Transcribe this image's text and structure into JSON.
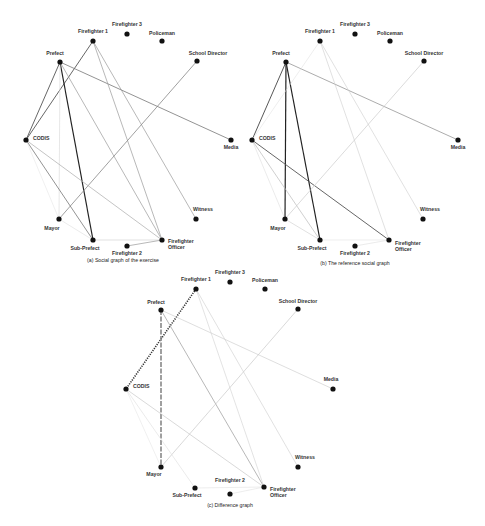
{
  "figure": {
    "panels": [
      {
        "id": "a",
        "caption": "(a) Social graph of the exercise",
        "offset": [
          0,
          0
        ],
        "caption_pos": [
          123,
          262
        ],
        "nodes": [
          {
            "name": "Firefighter 1",
            "x": 93,
            "y": 41,
            "lx": 93,
            "ly": 33,
            "anchor": "middle"
          },
          {
            "name": "Firefighter 3",
            "x": 127,
            "y": 34,
            "lx": 127,
            "ly": 26,
            "anchor": "middle"
          },
          {
            "name": "Policeman",
            "x": 162,
            "y": 41,
            "lx": 162,
            "ly": 35,
            "anchor": "middle"
          },
          {
            "name": "Prefect",
            "x": 60,
            "y": 62,
            "lx": 55,
            "ly": 55,
            "anchor": "middle"
          },
          {
            "name": "School Director",
            "x": 197,
            "y": 61,
            "lx": 208,
            "ly": 55,
            "anchor": "middle"
          },
          {
            "name": "CODIS",
            "x": 26,
            "y": 140,
            "lx": 33,
            "ly": 140,
            "anchor": "start"
          },
          {
            "name": "Media",
            "x": 231,
            "y": 140,
            "lx": 231,
            "ly": 149,
            "anchor": "middle"
          },
          {
            "name": "Mayor",
            "x": 59,
            "y": 219,
            "lx": 52,
            "ly": 230,
            "anchor": "middle"
          },
          {
            "name": "Witness",
            "x": 196,
            "y": 219,
            "lx": 203,
            "ly": 211,
            "anchor": "middle"
          },
          {
            "name": "Sub-Prefect",
            "x": 93,
            "y": 240,
            "lx": 85,
            "ly": 250,
            "anchor": "middle"
          },
          {
            "name": "Firefighter 2",
            "x": 127,
            "y": 246,
            "lx": 127,
            "ly": 255,
            "anchor": "middle"
          },
          {
            "name": "Firefighter Officer",
            "x": 162,
            "y": 240,
            "lx": 168,
            "ly": 243,
            "anchor": "start",
            "multiline": [
              "Firefighter",
              "Officer"
            ]
          }
        ],
        "edges": [
          {
            "from": "Prefect",
            "to": "CODIS",
            "color": "#555555",
            "width": 0.9,
            "style": "solid"
          },
          {
            "from": "Firefighter 1",
            "to": "CODIS",
            "color": "#555555",
            "width": 0.9,
            "style": "solid"
          },
          {
            "from": "Prefect",
            "to": "Sub-Prefect",
            "color": "#222222",
            "width": 1.2,
            "style": "solid"
          },
          {
            "from": "Prefect",
            "to": "Mayor",
            "color": "#dddddd",
            "width": 0.7,
            "style": "solid"
          },
          {
            "from": "Prefect",
            "to": "Media",
            "color": "#777777",
            "width": 0.8,
            "style": "solid"
          },
          {
            "from": "Prefect",
            "to": "Firefighter Officer",
            "color": "#999999",
            "width": 0.7,
            "style": "solid"
          },
          {
            "from": "Firefighter 1",
            "to": "Firefighter Officer",
            "color": "#999999",
            "width": 0.7,
            "style": "solid"
          },
          {
            "from": "Firefighter 1",
            "to": "Witness",
            "color": "#999999",
            "width": 0.7,
            "style": "solid"
          },
          {
            "from": "School Director",
            "to": "Mayor",
            "color": "#888888",
            "width": 0.8,
            "style": "solid"
          },
          {
            "from": "CODIS",
            "to": "Sub-Prefect",
            "color": "#777777",
            "width": 0.8,
            "style": "solid"
          },
          {
            "from": "CODIS",
            "to": "Firefighter Officer",
            "color": "#aaaaaa",
            "width": 0.7,
            "style": "solid"
          },
          {
            "from": "CODIS",
            "to": "Mayor",
            "color": "#e6e6e6",
            "width": 0.6,
            "style": "solid"
          },
          {
            "from": "Mayor",
            "to": "Sub-Prefect",
            "color": "#dddddd",
            "width": 0.6,
            "style": "solid"
          },
          {
            "from": "Sub-Prefect",
            "to": "Firefighter Officer",
            "color": "#cccccc",
            "width": 0.6,
            "style": "solid"
          },
          {
            "from": "Firefighter 2",
            "to": "Firefighter Officer",
            "color": "#999999",
            "width": 0.7,
            "style": "solid"
          }
        ]
      },
      {
        "id": "b",
        "caption": "(b) The reference social graph",
        "offset": [
          226,
          0
        ],
        "caption_pos": [
          129,
          265
        ],
        "nodes": [
          {
            "name": "Firefighter 1",
            "x": 94,
            "y": 41,
            "lx": 94,
            "ly": 33,
            "anchor": "middle"
          },
          {
            "name": "Firefighter 3",
            "x": 129,
            "y": 34,
            "lx": 129,
            "ly": 26,
            "anchor": "middle"
          },
          {
            "name": "Policeman",
            "x": 164,
            "y": 41,
            "lx": 164,
            "ly": 35,
            "anchor": "middle"
          },
          {
            "name": "Prefect",
            "x": 60,
            "y": 62,
            "lx": 55,
            "ly": 55,
            "anchor": "middle"
          },
          {
            "name": "School Director",
            "x": 198,
            "y": 61,
            "lx": 198,
            "ly": 55,
            "anchor": "middle"
          },
          {
            "name": "CODIS",
            "x": 26,
            "y": 140,
            "lx": 33,
            "ly": 140,
            "anchor": "start"
          },
          {
            "name": "Media",
            "x": 232,
            "y": 140,
            "lx": 232,
            "ly": 149,
            "anchor": "middle"
          },
          {
            "name": "Mayor",
            "x": 59,
            "y": 219,
            "lx": 52,
            "ly": 230,
            "anchor": "middle"
          },
          {
            "name": "Witness",
            "x": 197,
            "y": 219,
            "lx": 204,
            "ly": 211,
            "anchor": "middle"
          },
          {
            "name": "Sub-Prefect",
            "x": 94,
            "y": 240,
            "lx": 86,
            "ly": 250,
            "anchor": "middle"
          },
          {
            "name": "Firefighter 2",
            "x": 129,
            "y": 246,
            "lx": 129,
            "ly": 255,
            "anchor": "middle"
          },
          {
            "name": "Firefighter Officer",
            "x": 163,
            "y": 240,
            "lx": 169,
            "ly": 245,
            "anchor": "start",
            "multiline": [
              "Firefighter",
              "Officer"
            ]
          }
        ],
        "edges": [
          {
            "from": "Prefect",
            "to": "CODIS",
            "color": "#444444",
            "width": 0.9,
            "style": "solid"
          },
          {
            "from": "Prefect",
            "to": "Mayor",
            "color": "#222222",
            "width": 1.2,
            "style": "solid"
          },
          {
            "from": "Prefect",
            "to": "Sub-Prefect",
            "color": "#222222",
            "width": 1.2,
            "style": "solid"
          },
          {
            "from": "Prefect",
            "to": "Media",
            "color": "#888888",
            "width": 0.7,
            "style": "solid"
          },
          {
            "from": "CODIS",
            "to": "Firefighter Officer",
            "color": "#555555",
            "width": 0.9,
            "style": "solid"
          },
          {
            "from": "CODIS",
            "to": "Sub-Prefect",
            "color": "#bbbbbb",
            "width": 0.7,
            "style": "solid"
          },
          {
            "from": "CODIS",
            "to": "Mayor",
            "color": "#dddddd",
            "width": 0.6,
            "style": "solid"
          },
          {
            "from": "Firefighter 1",
            "to": "CODIS",
            "color": "#e3e3e3",
            "width": 0.6,
            "style": "solid"
          },
          {
            "from": "Firefighter 1",
            "to": "Firefighter Officer",
            "color": "#cccccc",
            "width": 0.6,
            "style": "solid"
          },
          {
            "from": "Firefighter 1",
            "to": "Witness",
            "color": "#cccccc",
            "width": 0.6,
            "style": "solid"
          },
          {
            "from": "School Director",
            "to": "Mayor",
            "color": "#cccccc",
            "width": 0.7,
            "style": "solid"
          },
          {
            "from": "Mayor",
            "to": "Sub-Prefect",
            "color": "#cccccc",
            "width": 0.6,
            "style": "solid"
          },
          {
            "from": "Sub-Prefect",
            "to": "Firefighter Officer",
            "color": "#e3e3e3",
            "width": 0.6,
            "style": "solid"
          },
          {
            "from": "Firefighter 2",
            "to": "Firefighter Officer",
            "color": "#dddddd",
            "width": 0.6,
            "style": "solid"
          }
        ]
      },
      {
        "id": "c",
        "caption": "(c) Difference graph",
        "offset": [
          101,
          249
        ],
        "caption_pos": [
          129,
          258
        ],
        "nodes": [
          {
            "name": "Firefighter 1",
            "x": 95,
            "y": 40,
            "lx": 95,
            "ly": 32,
            "anchor": "middle"
          },
          {
            "name": "Firefighter 3",
            "x": 129,
            "y": 33,
            "lx": 129,
            "ly": 25,
            "anchor": "middle"
          },
          {
            "name": "Policeman",
            "x": 164,
            "y": 40,
            "lx": 164,
            "ly": 33,
            "anchor": "middle"
          },
          {
            "name": "Prefect",
            "x": 60,
            "y": 61,
            "lx": 55,
            "ly": 55,
            "anchor": "middle"
          },
          {
            "name": "School Director",
            "x": 197,
            "y": 60,
            "lx": 197,
            "ly": 54,
            "anchor": "middle"
          },
          {
            "name": "CODIS",
            "x": 25,
            "y": 140,
            "lx": 32,
            "ly": 139,
            "anchor": "start"
          },
          {
            "name": "Media",
            "x": 232,
            "y": 140,
            "lx": 230,
            "ly": 132,
            "anchor": "middle"
          },
          {
            "name": "Mayor",
            "x": 60,
            "y": 218,
            "lx": 53,
            "ly": 227,
            "anchor": "middle"
          },
          {
            "name": "Witness",
            "x": 197,
            "y": 218,
            "lx": 204,
            "ly": 210,
            "anchor": "middle"
          },
          {
            "name": "Sub-Prefect",
            "x": 94,
            "y": 239,
            "lx": 86,
            "ly": 248,
            "anchor": "middle"
          },
          {
            "name": "Firefighter 2",
            "x": 129,
            "y": 245,
            "lx": 129,
            "ly": 233,
            "anchor": "middle"
          },
          {
            "name": "Firefighter Officer",
            "x": 163,
            "y": 238,
            "lx": 169,
            "ly": 242,
            "anchor": "start",
            "multiline": [
              "Firefighter",
              "Officer"
            ]
          }
        ],
        "edges": [
          {
            "from": "Firefighter 1",
            "to": "CODIS",
            "color": "#333333",
            "width": 1.6,
            "style": "dotted"
          },
          {
            "from": "Prefect",
            "to": "Mayor",
            "color": "#888888",
            "width": 1.6,
            "style": "dashed"
          },
          {
            "from": "Prefect",
            "to": "Firefighter Officer",
            "color": "#999999",
            "width": 0.7,
            "style": "solid"
          },
          {
            "from": "Prefect",
            "to": "Media",
            "color": "#d0d0d0",
            "width": 0.7,
            "style": "solid"
          },
          {
            "from": "Firefighter 1",
            "to": "Firefighter Officer",
            "color": "#d0d0d0",
            "width": 0.6,
            "style": "solid"
          },
          {
            "from": "Firefighter 1",
            "to": "Witness",
            "color": "#cccccc",
            "width": 0.6,
            "style": "solid"
          },
          {
            "from": "School Director",
            "to": "Mayor",
            "color": "#c8c8c8",
            "width": 0.7,
            "style": "solid"
          },
          {
            "from": "CODIS",
            "to": "Firefighter Officer",
            "color": "#c0c0c0",
            "width": 0.6,
            "style": "solid"
          },
          {
            "from": "CODIS",
            "to": "Sub-Prefect",
            "color": "#dddddd",
            "width": 0.6,
            "style": "solid"
          },
          {
            "from": "CODIS",
            "to": "Mayor",
            "color": "#e6e6e6",
            "width": 0.6,
            "style": "solid"
          },
          {
            "from": "Sub-Prefect",
            "to": "Firefighter Officer",
            "color": "#e0e0e0",
            "width": 0.6,
            "style": "solid"
          },
          {
            "from": "Firefighter 2",
            "to": "Firefighter Officer",
            "color": "#e0e0e0",
            "width": 0.6,
            "style": "solid"
          }
        ]
      }
    ]
  }
}
